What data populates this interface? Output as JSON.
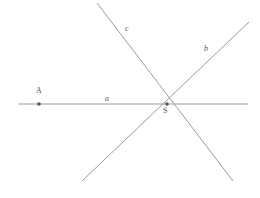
{
  "figure": {
    "width": 260,
    "height": 198,
    "background_color": "#ffffff",
    "stroke_color": "#9a9a9a",
    "label_color": "#555555",
    "point_color": "#555555",
    "stroke_width": 1
  },
  "labels": {
    "line_a": "a",
    "line_b": "b",
    "line_c": "c",
    "point_A": "A",
    "point_S": "S"
  },
  "geometry": {
    "lines": [
      {
        "name": "a",
        "label": "a",
        "description": "horizontal line",
        "x1": 18,
        "y1": 104,
        "x2": 248,
        "y2": 104,
        "label_x": 108,
        "label_y": 100
      },
      {
        "name": "b",
        "label": "b",
        "description": "line rising to the upper right",
        "x1": 82,
        "y1": 181,
        "x2": 249,
        "y2": 22,
        "label_x": 207,
        "label_y": 50
      },
      {
        "name": "c",
        "label": "c",
        "description": "line falling to the lower right",
        "x1": 97,
        "y1": 3,
        "x2": 233,
        "y2": 181,
        "label_x": 128,
        "label_y": 30
      }
    ],
    "points": [
      {
        "name": "A",
        "label": "A",
        "x": 39,
        "y": 104,
        "on_line": "a",
        "label_x": 39,
        "label_y": 92
      },
      {
        "name": "S",
        "label": "S",
        "x": 167,
        "y": 104,
        "on_line": "a, b, c",
        "description": "common intersection point of lines a, b and c",
        "label_x": 166,
        "label_y": 112
      }
    ]
  }
}
